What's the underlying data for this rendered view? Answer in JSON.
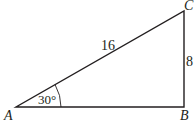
{
  "diagram": {
    "type": "right-triangle",
    "vertices": {
      "A": {
        "label": "A",
        "x": 16,
        "y": 107
      },
      "B": {
        "label": "B",
        "x": 184,
        "y": 107
      },
      "C": {
        "label": "C",
        "x": 184,
        "y": 11
      }
    },
    "sides": {
      "hypotenuse_AC": {
        "label": "16"
      },
      "leg_BC": {
        "label": "8"
      }
    },
    "angle_A": {
      "label": "30°"
    },
    "stroke_color": "#231f20",
    "background_color": "#ffffff"
  }
}
